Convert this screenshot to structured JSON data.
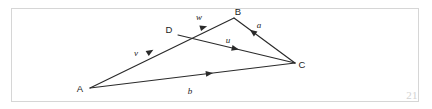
{
  "figure": {
    "page_number": "21",
    "frame_color": "#d6d6d6",
    "ink_color": "#2a2a2a",
    "background_color": "#ffffff"
  },
  "chart_data": {
    "type": "diagram",
    "title": "",
    "subtitle": "",
    "xlabel": "",
    "ylabel": "",
    "vertices": [
      {
        "id": "A",
        "label": "A",
        "x": 90,
        "y": 88,
        "label_x": 80,
        "label_y": 92
      },
      {
        "id": "B",
        "label": "B",
        "x": 234,
        "y": 18,
        "label_x": 238,
        "label_y": 15
      },
      {
        "id": "C",
        "label": "C",
        "x": 295,
        "y": 63,
        "label_x": 302,
        "label_y": 68
      },
      {
        "id": "D",
        "label": "D",
        "x": 178,
        "y": 35,
        "label_x": 169,
        "label_y": 33
      }
    ],
    "edges": [
      {
        "id": "AB",
        "from": "A",
        "to": "B",
        "note": "passes through D"
      },
      {
        "id": "AC",
        "from": "A",
        "to": "C",
        "note": "base of triangle"
      },
      {
        "id": "BC",
        "from": "B",
        "to": "C",
        "note": "right side"
      },
      {
        "id": "DC",
        "from": "D",
        "to": "C",
        "note": "internal cevian"
      }
    ],
    "vectors": [
      {
        "name": "v",
        "label": "v",
        "from": "A",
        "to": "D",
        "arrow_at": 0.72,
        "label_x": 136,
        "label_y": 56
      },
      {
        "name": "w",
        "label": "w",
        "from": "D",
        "to": "B",
        "arrow_at": 0.52,
        "label_x": 199,
        "label_y": 20
      },
      {
        "name": "u",
        "label": "u",
        "from": "D",
        "to": "C",
        "arrow_at": 0.52,
        "label_x": 228,
        "label_y": 43
      },
      {
        "name": "a",
        "label": "a",
        "from": "C",
        "to": "B",
        "arrow_at": 0.74,
        "label_x": 259,
        "label_y": 28
      },
      {
        "name": "b",
        "label": "b",
        "from": "A",
        "to": "C",
        "arrow_at": 0.6,
        "label_x": 190,
        "label_y": 94
      }
    ],
    "grid": false,
    "legend": null,
    "axis_visible": false
  }
}
